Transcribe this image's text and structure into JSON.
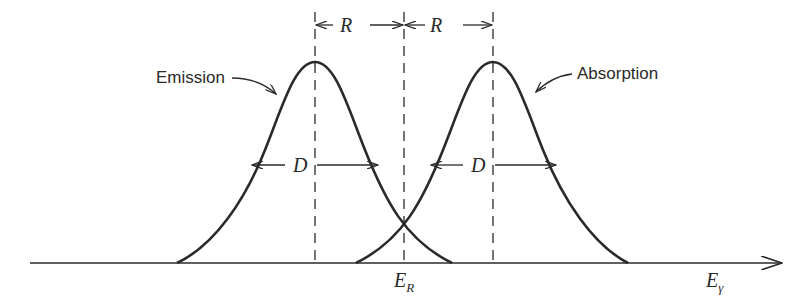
{
  "diagram": {
    "curves": [
      {
        "name": "Emission",
        "peak_x": 315,
        "label": "Emission"
      },
      {
        "name": "Absorption",
        "peak_x": 493,
        "label": "Absorption"
      }
    ],
    "labels": {
      "emission": "Emission",
      "absorption": "Absorption",
      "recoil_left": "R",
      "recoil_right": "R",
      "width_left": "D",
      "width_right": "D",
      "center_main": "E",
      "center_sub": "R",
      "axis_main": "E",
      "axis_sub": "γ"
    },
    "colors": {
      "ink": "#2a2a2a",
      "background": "#ffffff"
    }
  }
}
